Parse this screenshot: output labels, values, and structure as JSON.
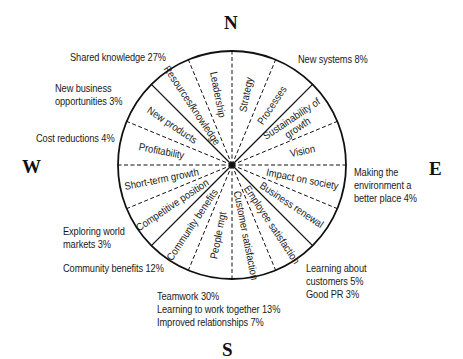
{
  "compass": {
    "north": "N",
    "south": "S",
    "east": "E",
    "west": "W"
  },
  "wheel": {
    "center": [
      232,
      165
    ],
    "radius": 114,
    "segments": [
      {
        "label": "Strategy",
        "line_after": "dashed"
      },
      {
        "label": "Processes",
        "line_after": "solid"
      },
      {
        "label": "Sustainability of growth",
        "lines": [
          "Sustainability of",
          "growth"
        ],
        "line_after": "dashed"
      },
      {
        "label": "Vision",
        "line_after": "dashed"
      },
      {
        "label": "Impact on society",
        "line_after": "dashed"
      },
      {
        "label": "Business renewal",
        "line_after": "solid"
      },
      {
        "label": "Employee satisfaction",
        "line_after": "dashed"
      },
      {
        "label": "Customer satisfaction",
        "line_after": "dashed"
      },
      {
        "label": "People mgt",
        "line_after": "dashed"
      },
      {
        "label": "Community benefits",
        "line_after": "solid"
      },
      {
        "label": "Competitive position",
        "line_after": "dashed"
      },
      {
        "label": "Short-term growth",
        "line_after": "dashed"
      },
      {
        "label": "Profitability",
        "line_after": "dashed"
      },
      {
        "label": "New products",
        "line_after": "solid"
      },
      {
        "label": "Resources/knowledge",
        "line_after": "dashed"
      },
      {
        "label": "Leadership",
        "line_after": "dashed"
      }
    ]
  },
  "annotations": {
    "shared_knowledge": [
      "Shared knowledge 27%"
    ],
    "new_business": [
      "New business",
      "opportunities 3%"
    ],
    "cost_reductions": [
      "Cost reductions 4%"
    ],
    "new_systems": [
      "New systems 8%"
    ],
    "environment": [
      "Making the",
      "environment a",
      "better place 4%"
    ],
    "learning_customers": [
      "Learning about",
      "customers 5%",
      "Good PR 3%"
    ],
    "exploring_markets": [
      "Exploring world",
      "markets 3%"
    ],
    "community_benefits": [
      "Community benefits 12%"
    ],
    "teamwork": [
      "Teamwork 30%",
      "Learning to work together 13%",
      "Improved relationships 7%"
    ]
  }
}
